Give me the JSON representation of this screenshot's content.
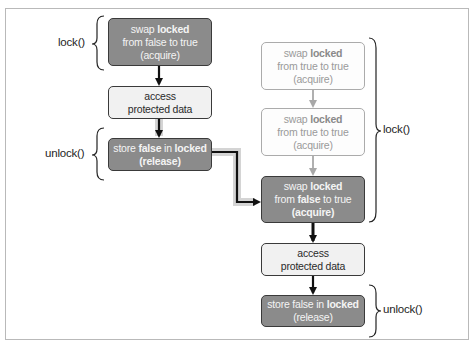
{
  "diagram": {
    "left_column": {
      "boxes": [
        {
          "id": "left-swap",
          "style": "dark",
          "line1_pre": "swap ",
          "line1_bold": "locked",
          "line2": "from false to true",
          "line3": "(acquire)"
        },
        {
          "id": "left-access",
          "style": "light",
          "line1": "access",
          "line2": "protected data"
        },
        {
          "id": "left-store",
          "style": "dark",
          "line1_pre": "store ",
          "line1_bold": "false",
          "line1_mid": " in ",
          "line1_bold2": "locked",
          "line2": "(release)"
        }
      ],
      "braces": [
        {
          "label": "lock()"
        },
        {
          "label": "unlock()"
        }
      ]
    },
    "right_column": {
      "boxes": [
        {
          "id": "right-swap-1",
          "style": "faded",
          "line1_pre": "swap ",
          "line1_bold": "locked",
          "line2": "from true to true",
          "line3": "(acquire)"
        },
        {
          "id": "right-swap-2",
          "style": "faded",
          "line1_pre": "swap ",
          "line1_bold": "locked",
          "line2": "from true to true",
          "line3": "(acquire)"
        },
        {
          "id": "right-swap-3",
          "style": "dark",
          "line1_pre": "swap ",
          "line1_bold": "locked",
          "line2_pre": "from ",
          "line2_bold": "false",
          "line2_post": " to true",
          "line3": "(acquire)"
        },
        {
          "id": "right-access",
          "style": "light",
          "line1": "access",
          "line2": "protected data"
        },
        {
          "id": "right-store",
          "style": "dark",
          "line1_pre": "store false in ",
          "line1_bold": "locked",
          "line2": "(release)"
        }
      ],
      "braces": [
        {
          "label": "lock()"
        },
        {
          "label": "unlock()"
        }
      ]
    },
    "colors": {
      "dark_fill": "#8b8b8b",
      "light_fill": "#f1f1f1",
      "faded_border": "#ababab",
      "arrow": "#111111",
      "faded_arrow": "#a8a8a8",
      "highlight_glow": "#d4d4d4"
    }
  }
}
